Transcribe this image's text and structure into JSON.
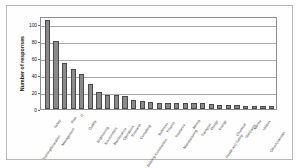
{
  "figure": {
    "frame_color": "#b9b9b9",
    "background": "#ffffff"
  },
  "chart_data": {
    "type": "bar",
    "title": "",
    "xlabel": "",
    "ylabel": "Number of responses",
    "ylim": [
      0,
      110
    ],
    "yticks": [
      0,
      20,
      40,
      60,
      80,
      100
    ],
    "grid": true,
    "legend": "none",
    "bar_color": "#8a8a8a",
    "bar_edge_color": "#4a4a4a",
    "categories": [
      "Training/Education",
      "Safety",
      "Management",
      "Risk",
      "IT",
      "Quality",
      "Engineering",
      "Environment",
      "Maintenance",
      "Operations",
      "Research",
      "Consulting",
      "Building Construction",
      "Business",
      "Finance",
      "Insurance",
      "Manufacturing",
      "Mining",
      "Transport",
      "Design",
      "Energy",
      "Health and Safety",
      "Chemical",
      "Standards",
      "Marine",
      "Utilities",
      "Other/Unknown"
    ],
    "values": [
      105,
      80,
      54,
      47,
      41,
      29,
      20,
      17,
      17,
      15,
      11,
      10,
      8,
      7,
      7,
      7,
      7,
      7,
      7,
      6,
      5,
      5,
      5,
      4,
      4,
      4,
      4
    ]
  }
}
